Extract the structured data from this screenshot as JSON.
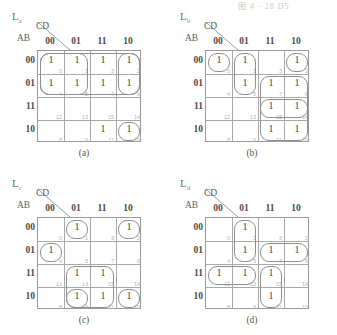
{
  "page": {
    "header_fragment": "图 4 - 28    D5"
  },
  "kmap": {
    "cd_axis_label": "CD",
    "ab_axis_label": "AB",
    "col_headers": [
      "00",
      "01",
      "11",
      "10"
    ],
    "row_headers": [
      "00",
      "01",
      "11",
      "10"
    ],
    "cell_index_grid": [
      [
        0,
        1,
        3,
        2
      ],
      [
        4,
        5,
        7,
        6
      ],
      [
        12,
        13,
        15,
        14
      ],
      [
        8,
        9,
        11,
        10
      ]
    ],
    "one_symbol": "1"
  },
  "panels": [
    {
      "id": "a",
      "caption": "(a)",
      "output_name": "L",
      "output_subscript": "a",
      "minterms": [
        0,
        1,
        3,
        2,
        4,
        5,
        7,
        6,
        11,
        10
      ],
      "cells": [
        [
          "1",
          "1",
          "1",
          "1"
        ],
        [
          "1",
          "1",
          "1",
          "1"
        ],
        [
          "",
          "",
          "",
          ""
        ],
        [
          "",
          "",
          "1",
          "1"
        ]
      ],
      "loops": [
        {
          "name": "loop-row00-row01-left",
          "left": 0,
          "top": 0,
          "width": 52,
          "height": 46
        },
        {
          "name": "loop-col11-col10-row00-row01",
          "left": 78,
          "top": 0,
          "width": 26,
          "height": 46
        },
        {
          "name": "loop-row00-row01-full",
          "left": 0,
          "top": 0,
          "width": 104,
          "height": 46
        },
        {
          "name": "loop-row10-right",
          "left": 78,
          "top": 69,
          "width": 26,
          "height": 23
        }
      ]
    },
    {
      "id": "b",
      "caption": "(b)",
      "output_name": "L",
      "output_subscript": "b",
      "minterms": [
        0,
        1,
        2,
        5,
        7,
        6,
        15,
        14,
        11,
        10
      ],
      "cells": [
        [
          "1",
          "1",
          "",
          "1"
        ],
        [
          "",
          "1",
          "1",
          "1"
        ],
        [
          "",
          "",
          "1",
          "1"
        ],
        [
          "",
          "",
          "1",
          "1"
        ]
      ],
      "loops": [
        {
          "name": "loop-cell0",
          "left": 0,
          "top": 0,
          "width": 26,
          "height": 23
        },
        {
          "name": "loop-col01-row00-row01",
          "left": 26,
          "top": 0,
          "width": 26,
          "height": 46
        },
        {
          "name": "loop-cell2",
          "left": 78,
          "top": 0,
          "width": 26,
          "height": 23
        },
        {
          "name": "loop-col11-col10-rows01-10",
          "left": 52,
          "top": 23,
          "width": 52,
          "height": 69
        },
        {
          "name": "loop-row11-right",
          "left": 52,
          "top": 46,
          "width": 52,
          "height": 23
        }
      ]
    },
    {
      "id": "c",
      "caption": "(c)",
      "output_name": "L",
      "output_subscript": "c",
      "minterms": [
        1,
        2,
        4,
        13,
        15,
        9,
        11,
        10
      ],
      "cells": [
        [
          "",
          "1",
          "",
          "1"
        ],
        [
          "1",
          "",
          "",
          ""
        ],
        [
          "",
          "1",
          "1",
          ""
        ],
        [
          "",
          "1",
          "1",
          "1"
        ]
      ],
      "loops": [
        {
          "name": "loop-cell1",
          "left": 26,
          "top": 0,
          "width": 26,
          "height": 23
        },
        {
          "name": "loop-cell2",
          "left": 78,
          "top": 0,
          "width": 26,
          "height": 23
        },
        {
          "name": "loop-cell4",
          "left": 0,
          "top": 23,
          "width": 26,
          "height": 23
        },
        {
          "name": "loop-rows11-10-middle",
          "left": 26,
          "top": 46,
          "width": 52,
          "height": 46
        },
        {
          "name": "loop-row10-col01",
          "left": 26,
          "top": 69,
          "width": 26,
          "height": 23
        },
        {
          "name": "loop-cell10",
          "left": 78,
          "top": 69,
          "width": 26,
          "height": 23
        }
      ]
    },
    {
      "id": "d",
      "caption": "(d)",
      "output_name": "L",
      "output_subscript": "d",
      "minterms": [
        1,
        5,
        7,
        6,
        12,
        13,
        15,
        11
      ],
      "cells": [
        [
          "",
          "1",
          "",
          ""
        ],
        [
          "",
          "1",
          "1",
          "1"
        ],
        [
          "1",
          "1",
          "1",
          ""
        ],
        [
          "",
          "",
          "1",
          ""
        ]
      ],
      "loops": [
        {
          "name": "loop-col01-row00-row01",
          "left": 26,
          "top": 0,
          "width": 26,
          "height": 46
        },
        {
          "name": "loop-row01-col11-col10",
          "left": 52,
          "top": 23,
          "width": 52,
          "height": 23
        },
        {
          "name": "loop-row11-col00-col01",
          "left": 0,
          "top": 46,
          "width": 52,
          "height": 23
        },
        {
          "name": "loop-col11-row11-row10",
          "left": 52,
          "top": 46,
          "width": 26,
          "height": 46
        }
      ]
    }
  ]
}
